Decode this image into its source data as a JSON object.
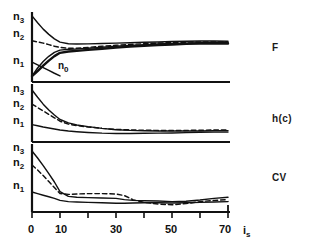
{
  "figure": {
    "background": "#ffffff",
    "ink": "#111111",
    "panel_count": 3
  },
  "axis": {
    "x_name": "i",
    "x_name_sub": "s",
    "x_ticks": [
      0,
      10,
      20,
      30,
      40,
      50,
      60,
      70
    ],
    "x_tick_labels": [
      "0",
      "10",
      "",
      "30",
      "",
      "50",
      "",
      "70"
    ],
    "x_min": 0,
    "x_max": 70,
    "y_tick_labels": [
      "n",
      "n",
      "n"
    ],
    "y_tick_subs": [
      "3",
      "2",
      "1"
    ],
    "y_min_label": "",
    "y_max_label": ""
  },
  "annotations": [
    {
      "text": "n",
      "sub": "0",
      "panel": 0
    }
  ],
  "panels": [
    {
      "id": "F",
      "label": "F"
    },
    {
      "id": "hc",
      "label": "h(c)"
    },
    {
      "id": "CV",
      "label": "CV"
    }
  ],
  "chart_data": {
    "type": "line",
    "title": "",
    "xlabel": "i_s",
    "ylabel": "",
    "xlim": [
      0,
      70
    ],
    "grid": false,
    "legend": null,
    "panels": [
      {
        "name": "F",
        "ylim": [
          0,
          3.6
        ],
        "ytick_values": [
          1,
          2,
          3
        ],
        "ytick_labels": [
          "n1",
          "n2",
          "n3"
        ],
        "annotation": {
          "label": "n0",
          "x": 13,
          "y": 0.62
        },
        "series": [
          {
            "name": "upper-solid",
            "style": "solid",
            "x": [
              0,
              2,
              4,
              6,
              8,
              10,
              13,
              16,
              20,
              25,
              30,
              35,
              40,
              45,
              50,
              55,
              60,
              65,
              70
            ],
            "values": [
              3.4,
              3.05,
              2.72,
              2.45,
              2.22,
              2.05,
              1.97,
              1.95,
              1.96,
              1.98,
              2.0,
              2.02,
              2.04,
              2.06,
              2.08,
              2.1,
              2.11,
              2.11,
              2.1
            ]
          },
          {
            "name": "dashed-middle",
            "style": "dashed",
            "x": [
              0,
              2,
              4,
              6,
              8,
              10,
              13,
              16,
              20,
              25,
              30,
              35,
              40,
              45,
              50,
              55,
              60,
              65,
              70
            ],
            "values": [
              2.12,
              2.06,
              2.0,
              1.92,
              1.84,
              1.78,
              1.74,
              1.74,
              1.78,
              1.84,
              1.89,
              1.93,
              1.97,
              2.0,
              2.03,
              2.05,
              2.06,
              2.06,
              2.05
            ]
          },
          {
            "name": "mid-solid",
            "style": "solid",
            "x": [
              0,
              2,
              4,
              6,
              8,
              10,
              13,
              16,
              20,
              25,
              30,
              35,
              40,
              45,
              50,
              55,
              60,
              65,
              70
            ],
            "values": [
              0.3,
              0.72,
              1.05,
              1.32,
              1.52,
              1.64,
              1.68,
              1.7,
              1.74,
              1.79,
              1.84,
              1.88,
              1.92,
              1.95,
              1.98,
              2.0,
              2.02,
              2.03,
              2.02
            ]
          },
          {
            "name": "lower-solid-thick",
            "style": "solid",
            "x": [
              0,
              2,
              4,
              6,
              8,
              10,
              13,
              16,
              20,
              25,
              30,
              35,
              40,
              45,
              50,
              55,
              60,
              65,
              70
            ],
            "values": [
              0.3,
              0.56,
              0.84,
              1.1,
              1.33,
              1.5,
              1.57,
              1.6,
              1.65,
              1.71,
              1.77,
              1.82,
              1.86,
              1.9,
              1.93,
              1.96,
              1.98,
              1.99,
              1.98
            ]
          },
          {
            "name": "lower-branch",
            "style": "solid",
            "x": [
              0,
              2,
              4,
              6,
              8,
              10
            ],
            "values": [
              1.02,
              0.88,
              0.74,
              0.6,
              0.45,
              0.31
            ]
          }
        ]
      },
      {
        "name": "h(c)",
        "ylim": [
          0,
          3.4
        ],
        "ytick_values": [
          1,
          2,
          3
        ],
        "ytick_labels": [
          "n1",
          "n2",
          "n3"
        ],
        "series": [
          {
            "name": "upper-solid",
            "style": "solid",
            "x": [
              0,
              2,
              4,
              6,
              8,
              10,
              13,
              16,
              20,
              25,
              30,
              35,
              40,
              45,
              50,
              55,
              60,
              65,
              70
            ],
            "values": [
              3.05,
              2.62,
              2.22,
              1.88,
              1.58,
              1.32,
              1.12,
              1.0,
              0.9,
              0.8,
              0.72,
              0.68,
              0.66,
              0.65,
              0.64,
              0.64,
              0.65,
              0.66,
              0.66
            ]
          },
          {
            "name": "dashed",
            "style": "dashed",
            "x": [
              0,
              2,
              4,
              6,
              8,
              10,
              13,
              16,
              20,
              25,
              30,
              35,
              40,
              45,
              50,
              55,
              60,
              65,
              70
            ],
            "values": [
              2.22,
              2.02,
              1.82,
              1.62,
              1.42,
              1.22,
              1.05,
              0.96,
              0.88,
              0.8,
              0.74,
              0.71,
              0.69,
              0.68,
              0.68,
              0.68,
              0.69,
              0.7,
              0.7
            ]
          },
          {
            "name": "lower-solid",
            "style": "solid",
            "x": [
              0,
              2,
              4,
              6,
              8,
              10,
              13,
              16,
              20,
              25,
              30,
              35,
              40,
              45,
              50,
              55,
              60,
              65,
              70
            ],
            "values": [
              1.02,
              0.95,
              0.88,
              0.82,
              0.76,
              0.7,
              0.64,
              0.6,
              0.56,
              0.52,
              0.5,
              0.5,
              0.51,
              0.52,
              0.53,
              0.55,
              0.57,
              0.58,
              0.58
            ]
          }
        ]
      },
      {
        "name": "CV",
        "ylim": [
          0,
          3.4
        ],
        "ytick_values": [
          1,
          2,
          3
        ],
        "ytick_labels": [
          "n1",
          "n2",
          "n3"
        ],
        "series": [
          {
            "name": "upper-solid",
            "style": "solid",
            "x": [
              0,
              2,
              4,
              6,
              8,
              10,
              13,
              16,
              20,
              25,
              30,
              33,
              36,
              40,
              45,
              50,
              55,
              60,
              65,
              70
            ],
            "values": [
              3.05,
              2.7,
              2.32,
              1.92,
              1.5,
              1.02,
              0.78,
              0.74,
              0.72,
              0.7,
              0.68,
              0.62,
              0.58,
              0.56,
              0.55,
              0.52,
              0.54,
              0.6,
              0.68,
              0.74
            ]
          },
          {
            "name": "dashed",
            "style": "dashed",
            "x": [
              0,
              2,
              4,
              6,
              8,
              10,
              13,
              16,
              20,
              25,
              30,
              33,
              36,
              40,
              45,
              50,
              55,
              60,
              65,
              70
            ],
            "values": [
              2.35,
              2.1,
              1.82,
              1.52,
              1.22,
              0.92,
              0.88,
              0.9,
              0.92,
              0.92,
              0.9,
              0.82,
              0.62,
              0.48,
              0.4,
              0.36,
              0.42,
              0.52,
              0.58,
              0.62
            ]
          },
          {
            "name": "lower-solid",
            "style": "solid",
            "x": [
              0,
              2,
              4,
              6,
              8,
              10,
              13,
              16,
              20,
              25,
              30,
              33,
              36,
              40,
              45,
              50,
              55,
              60,
              65,
              70
            ],
            "values": [
              1.0,
              0.92,
              0.84,
              0.76,
              0.68,
              0.58,
              0.52,
              0.5,
              0.48,
              0.46,
              0.44,
              0.44,
              0.45,
              0.46,
              0.46,
              0.45,
              0.46,
              0.48,
              0.5,
              0.52
            ]
          }
        ]
      }
    ]
  }
}
